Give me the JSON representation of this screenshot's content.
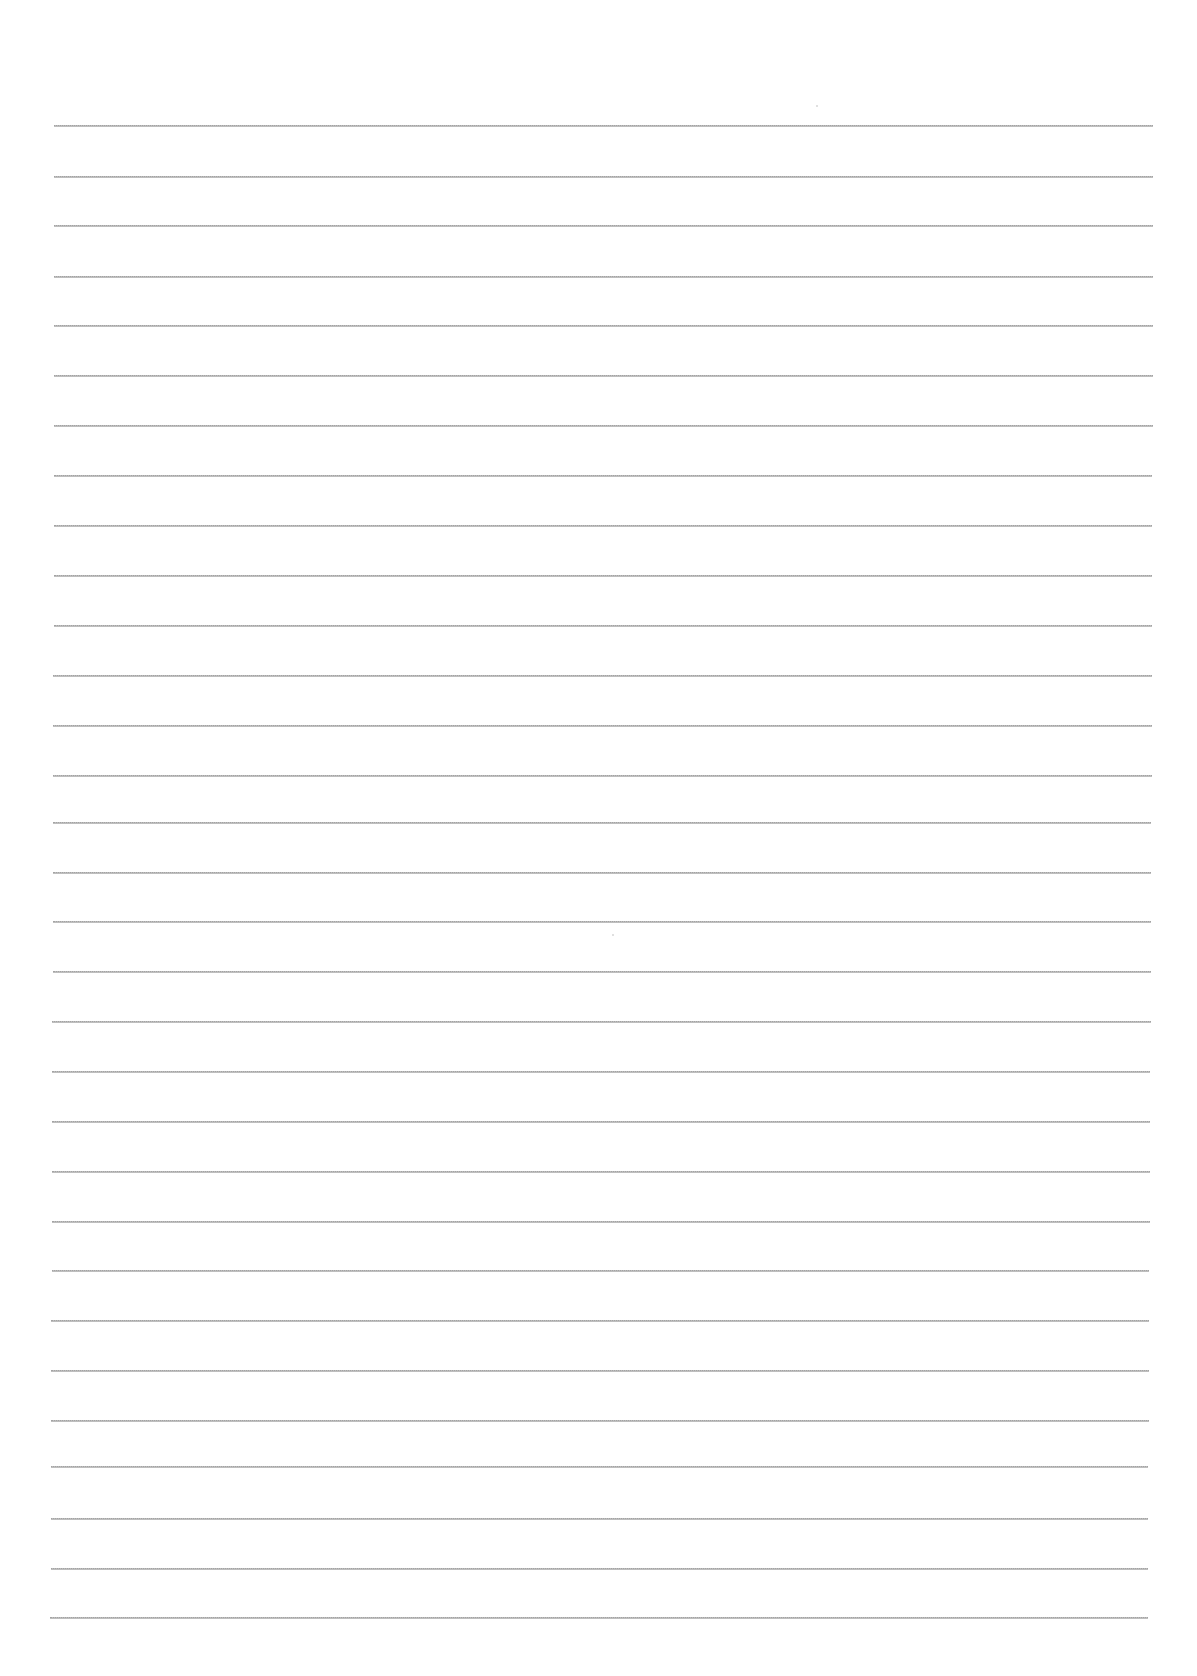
{
  "document": {
    "type": "blank lined paper",
    "background_color": "#ffffff",
    "line_color": "#9a9a9a",
    "line_count": 31,
    "lines": [
      {
        "y": 125,
        "x1": 54,
        "x2": 1153
      },
      {
        "y": 176,
        "x1": 54,
        "x2": 1153
      },
      {
        "y": 225,
        "x1": 54,
        "x2": 1153
      },
      {
        "y": 276,
        "x1": 54,
        "x2": 1153
      },
      {
        "y": 325,
        "x1": 54,
        "x2": 1153
      },
      {
        "y": 375,
        "x1": 54,
        "x2": 1153
      },
      {
        "y": 425,
        "x1": 54,
        "x2": 1153
      },
      {
        "y": 475,
        "x1": 54,
        "x2": 1152
      },
      {
        "y": 525,
        "x1": 54,
        "x2": 1152
      },
      {
        "y": 575,
        "x1": 54,
        "x2": 1152
      },
      {
        "y": 625,
        "x1": 54,
        "x2": 1152
      },
      {
        "y": 675,
        "x1": 53,
        "x2": 1152
      },
      {
        "y": 725,
        "x1": 53,
        "x2": 1152
      },
      {
        "y": 775,
        "x1": 53,
        "x2": 1152
      },
      {
        "y": 822,
        "x1": 53,
        "x2": 1151
      },
      {
        "y": 872,
        "x1": 53,
        "x2": 1151
      },
      {
        "y": 921,
        "x1": 53,
        "x2": 1151
      },
      {
        "y": 971,
        "x1": 53,
        "x2": 1151
      },
      {
        "y": 1021,
        "x1": 52,
        "x2": 1151
      },
      {
        "y": 1071,
        "x1": 52,
        "x2": 1150
      },
      {
        "y": 1121,
        "x1": 52,
        "x2": 1150
      },
      {
        "y": 1171,
        "x1": 52,
        "x2": 1150
      },
      {
        "y": 1221,
        "x1": 52,
        "x2": 1150
      },
      {
        "y": 1270,
        "x1": 52,
        "x2": 1149
      },
      {
        "y": 1320,
        "x1": 51,
        "x2": 1149
      },
      {
        "y": 1370,
        "x1": 51,
        "x2": 1149
      },
      {
        "y": 1420,
        "x1": 51,
        "x2": 1149
      },
      {
        "y": 1466,
        "x1": 51,
        "x2": 1148
      },
      {
        "y": 1518,
        "x1": 51,
        "x2": 1148
      },
      {
        "y": 1568,
        "x1": 51,
        "x2": 1148
      },
      {
        "y": 1617,
        "x1": 50,
        "x2": 1148
      }
    ],
    "specks": [
      {
        "x": 612,
        "y": 934
      },
      {
        "x": 816,
        "y": 105
      }
    ]
  }
}
